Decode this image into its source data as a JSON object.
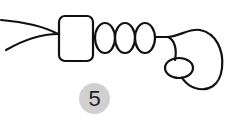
{
  "diagram": {
    "label": "5",
    "stroke_color": "#111111",
    "badge_color": "#d0d0d0",
    "parts": [
      "strand-left-upper",
      "strand-left-lower",
      "rectangle-bead",
      "oval-bead-1",
      "oval-bead-2",
      "oval-bead-3",
      "loop-cord",
      "oval-pendant"
    ]
  }
}
